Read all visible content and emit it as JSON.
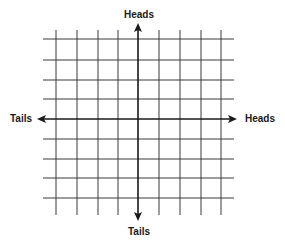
{
  "diagram": {
    "type": "coordinate-grid",
    "labels": {
      "top": "Heads",
      "bottom": "Tails",
      "left": "Tails",
      "right": "Heads"
    },
    "grid": {
      "vertical_lines_x": [
        56,
        77,
        98,
        118,
        159,
        180,
        201,
        221
      ],
      "horizontal_lines_y": [
        39,
        60,
        80,
        99,
        139,
        159,
        178,
        198
      ],
      "x_extent": [
        43,
        234
      ],
      "y_extent": [
        30,
        215
      ],
      "line_color": "#3a3a3a"
    },
    "axes": {
      "center_x": 138,
      "center_y": 119,
      "horizontal": {
        "x1": 37,
        "x2": 237,
        "arrows": "both"
      },
      "vertical": {
        "y1": 23,
        "y2": 221,
        "arrows": "both"
      },
      "color": "#1a1a1a"
    }
  }
}
